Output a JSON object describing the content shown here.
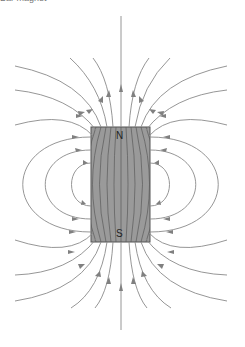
{
  "figure": {
    "caption_partial": "Bar magnet",
    "magnet": {
      "north_label": "N",
      "south_label": "S",
      "fill": "#9a9a9a",
      "outline": "#555555"
    },
    "field_line_color": "#8a8a8a"
  }
}
